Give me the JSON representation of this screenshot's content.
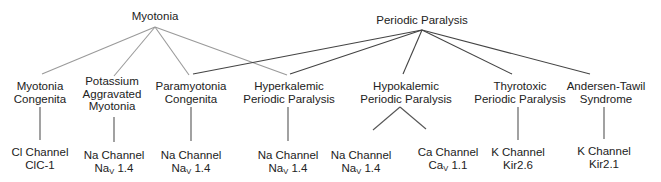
{
  "diagram": {
    "type": "tree",
    "colors": {
      "myotonia_edges": "#9a9a9a",
      "periodic_edges": "#444444",
      "text": "#222222"
    },
    "roots": [
      {
        "id": "myotonia",
        "label": "Myotonia",
        "x": 155,
        "y": 10
      },
      {
        "id": "periodic",
        "label": "Periodic Paralysis",
        "x": 422,
        "y": 14
      }
    ],
    "diseases": [
      {
        "id": "mc",
        "lines": [
          "Myotonia",
          "Congenita"
        ],
        "x": 40,
        "y": 100,
        "parents": [
          "myotonia"
        ]
      },
      {
        "id": "pam",
        "lines": [
          "Potassium",
          "Aggravated",
          "Myotonia"
        ],
        "x": 113,
        "y": 94,
        "parents": [
          "myotonia"
        ]
      },
      {
        "id": "pmc",
        "lines": [
          "Paramyotonia",
          "Congenita"
        ],
        "x": 191,
        "y": 100,
        "parents": [
          "myotonia",
          "periodic"
        ]
      },
      {
        "id": "hyperpp",
        "lines": [
          "Hyperkalemic",
          "Periodic Paralysis"
        ],
        "x": 289,
        "y": 100,
        "parents": [
          "myotonia",
          "periodic"
        ]
      },
      {
        "id": "hypopp",
        "lines": [
          "Hypokalemic",
          "Periodic Paralysis"
        ],
        "x": 407,
        "y": 100,
        "parents": [
          "periodic"
        ]
      },
      {
        "id": "ttpp",
        "lines": [
          "Thyrotoxic",
          "Periodic Paralysis"
        ],
        "x": 519,
        "y": 100,
        "parents": [
          "periodic"
        ]
      },
      {
        "id": "ats",
        "lines": [
          "Andersen-Tawil",
          "Syndrome"
        ],
        "x": 606,
        "y": 100,
        "parents": [
          "periodic"
        ]
      }
    ],
    "channels": [
      {
        "id": "c1",
        "line1": "Cl Channel",
        "line2_main": "ClC-1",
        "line2_sub": "",
        "line2_rest": "",
        "x": 40,
        "y": 147,
        "parent": "mc"
      },
      {
        "id": "c2",
        "line1": "Na Channel",
        "line2_main": "Na",
        "line2_sub": "V",
        "line2_rest": " 1.4",
        "x": 114,
        "y": 150,
        "parent": "pam"
      },
      {
        "id": "c3",
        "line1": "Na Channel",
        "line2_main": "Na",
        "line2_sub": "V",
        "line2_rest": " 1.4",
        "x": 191,
        "y": 150,
        "parent": "pmc"
      },
      {
        "id": "c4",
        "line1": "Na Channel",
        "line2_main": "Na",
        "line2_sub": "V",
        "line2_rest": " 1.4",
        "x": 288,
        "y": 150,
        "parent": "hyperpp"
      },
      {
        "id": "c5",
        "line1": "Na Channel",
        "line2_main": "Na",
        "line2_sub": "V",
        "line2_rest": " 1.4",
        "x": 361,
        "y": 150,
        "parent": "hypopp"
      },
      {
        "id": "c6",
        "line1": "Ca Channel",
        "line2_main": "Ca",
        "line2_sub": "V",
        "line2_rest": " 1.1",
        "x": 448,
        "y": 147,
        "parent": "hypopp"
      },
      {
        "id": "c7",
        "line1": "K Channel",
        "line2_main": "Kir2.6",
        "line2_sub": "",
        "line2_rest": "",
        "x": 518,
        "y": 150,
        "parent": "ttpp"
      },
      {
        "id": "c8",
        "line1": "K Channel",
        "line2_main": "Kir2.1",
        "line2_sub": "",
        "line2_rest": "",
        "x": 604,
        "y": 147,
        "parent": "ats"
      }
    ]
  }
}
